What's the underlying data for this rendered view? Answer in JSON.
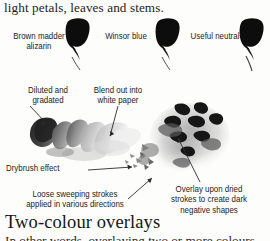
{
  "page": {
    "intro_line": "light petals, leaves and stems.",
    "section_heading": "Two-colour overlays",
    "heading_next_line": "In other words, overlaying two or more colours"
  },
  "swatch_labels": [
    {
      "id": "brown-madder-alizarin",
      "text": "Brown madder\nalizarin"
    },
    {
      "id": "winsor-blue",
      "text": "Winsor blue"
    },
    {
      "id": "useful-neutral",
      "text": "Useful neutral"
    }
  ],
  "annotations": [
    {
      "id": "diluted-and-gradated",
      "text": "Diluted and\ngradated"
    },
    {
      "id": "blend-out-into-white-paper",
      "text": "Blend out into\nwhite paper"
    },
    {
      "id": "drybrush-effect",
      "text": "Drybrush effect"
    },
    {
      "id": "loose-sweeping-strokes",
      "text": "Loose sweeping strokes\napplied in various directions"
    },
    {
      "id": "overlay-upon-dried-strokes",
      "text": "Overlay upon dried\nstrokes to create dark\nnegative shapes"
    }
  ],
  "colors": {
    "ink": "#1c1c1c",
    "caption_ink": "#232323",
    "swatch_black": "#0d0d0d",
    "wash_dark": "#3c3c3c",
    "wash_mid": "#8d8d8d",
    "wash_light": "#cfcfcf",
    "paper": "#fdfdfc"
  }
}
